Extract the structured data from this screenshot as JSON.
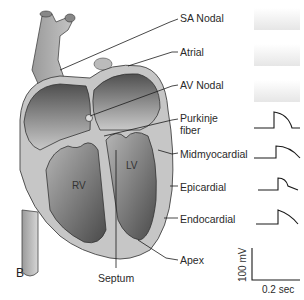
{
  "figure": {
    "panel_label": "B",
    "chambers": {
      "rv": "RV",
      "lv": "LV"
    },
    "labels": [
      {
        "id": "sa-nodal",
        "text": "SA Nodal"
      },
      {
        "id": "atrial",
        "text": "Atrial"
      },
      {
        "id": "av-nodal",
        "text": "AV Nodal"
      },
      {
        "id": "purkinje",
        "text": "Purkinje",
        "text2": "fiber"
      },
      {
        "id": "midmyocardial",
        "text": "Midmyocardial"
      },
      {
        "id": "epicardial",
        "text": "Epicardial"
      },
      {
        "id": "endocardial",
        "text": "Endocardial"
      },
      {
        "id": "apex",
        "text": "Apex"
      }
    ],
    "septum_label": "Septum",
    "scale_bar": {
      "voltage": "100 mV",
      "time": "0.2 sec"
    },
    "colors": {
      "heart_wall": "#c4c4c4",
      "chamber_dark": "#5a5a5a",
      "line": "#1a1a1a"
    }
  }
}
